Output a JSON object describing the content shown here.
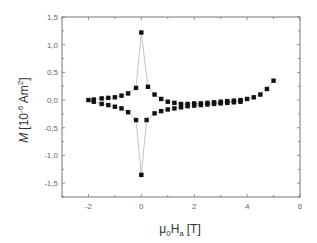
{
  "chart_data": {
    "type": "scatter",
    "title": "",
    "xlabel": "μ0Ha [T]",
    "xlabel_parts": {
      "mu": "μ",
      "mu_sub": "0",
      "h": "H",
      "h_sub": "a",
      "unit": "[T]"
    },
    "ylabel": "M [10^-6 Am^2]",
    "ylabel_parts": {
      "m": "M",
      "pre": "[10",
      "exp": "-6",
      "unit": " Am",
      "unit_exp": "2",
      "close": "]"
    },
    "xlim": [
      -3,
      6
    ],
    "ylim": [
      -1.75,
      1.5
    ],
    "xticks": [
      -2,
      0,
      2,
      4,
      6
    ],
    "xtick_labels": [
      "-2",
      "0",
      "2",
      "4",
      "6"
    ],
    "yticks": [
      1.5,
      1.0,
      0.5,
      0.0,
      -0.5,
      -1.0,
      -1.5
    ],
    "ytick_labels": [
      "1,5",
      "1,0",
      "0,5",
      "0,0",
      "-0,5",
      "-1,0",
      "-1,5"
    ],
    "grid": false,
    "legend": null,
    "marker": "square",
    "line_color": "#aaaaaa",
    "marker_color": "#111111",
    "series": [
      {
        "name": "upper branch",
        "x": [
          -2.0,
          -1.8,
          -1.5,
          -1.25,
          -1.0,
          -0.75,
          -0.5,
          -0.2,
          0.0,
          0.25,
          0.5,
          0.75,
          1.0,
          1.25,
          1.5,
          1.75,
          2.0,
          2.25,
          2.5,
          2.75,
          3.0,
          3.25,
          3.5,
          3.75,
          4.0,
          4.25,
          4.5,
          4.75,
          5.0
        ],
        "y": [
          0.0,
          0.01,
          0.03,
          0.04,
          0.05,
          0.08,
          0.12,
          0.22,
          1.22,
          0.24,
          0.1,
          0.02,
          -0.03,
          -0.05,
          -0.07,
          -0.07,
          -0.06,
          -0.06,
          -0.05,
          -0.04,
          -0.03,
          -0.02,
          -0.01,
          0.0,
          0.02,
          0.05,
          0.1,
          0.2,
          0.35
        ]
      },
      {
        "name": "lower branch",
        "x": [
          -1.8,
          -1.5,
          -1.25,
          -1.0,
          -0.75,
          -0.5,
          -0.2,
          0.0,
          0.2,
          0.5,
          0.75,
          1.0,
          1.25,
          1.5,
          1.75,
          2.0,
          2.25,
          2.5,
          2.75,
          3.0,
          3.25,
          3.5,
          3.75
        ],
        "y": [
          -0.03,
          -0.07,
          -0.09,
          -0.12,
          -0.15,
          -0.22,
          -0.36,
          -1.35,
          -0.36,
          -0.24,
          -0.2,
          -0.17,
          -0.15,
          -0.13,
          -0.11,
          -0.1,
          -0.09,
          -0.08,
          -0.07,
          -0.06,
          -0.05,
          -0.04,
          -0.03
        ]
      }
    ]
  }
}
